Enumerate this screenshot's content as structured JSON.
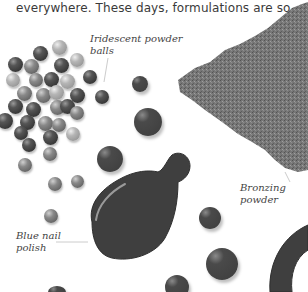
{
  "article": {
    "body_text": "everywhere. These days, formulations are so"
  },
  "illustration": {
    "labels": {
      "powder_balls": [
        "Iridescent powder",
        "balls"
      ],
      "bronzing": [
        "Bronzing",
        "powder"
      ],
      "nail_polish": [
        "Blue nail",
        "polish"
      ]
    },
    "colors": {
      "background": "#ffffff",
      "polish": "#3d3d3d",
      "powder": "#6e6e6e",
      "text": "#3a3a3a"
    }
  }
}
